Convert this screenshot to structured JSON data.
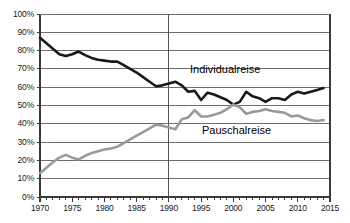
{
  "chart_data": {
    "type": "line",
    "title": "",
    "subtitle": "",
    "xlabel": "",
    "ylabel": "",
    "xlim": [
      1970,
      2015
    ],
    "ylim": [
      0,
      100
    ],
    "grid": true,
    "grid_axis": "y",
    "legend": "inline-annotations",
    "y_tick_labels": [
      "0%",
      "10%",
      "20%",
      "30%",
      "40%",
      "50%",
      "60%",
      "70%",
      "80%",
      "90%",
      "100%"
    ],
    "y_tick_values": [
      0,
      10,
      20,
      30,
      40,
      50,
      60,
      70,
      80,
      90,
      100
    ],
    "x_tick_labels": [
      "1970",
      "1975",
      "1980",
      "1985",
      "1990",
      "1995",
      "2000",
      "2005",
      "2010",
      "2015"
    ],
    "x_tick_values": [
      1970,
      1975,
      1980,
      1985,
      1990,
      1995,
      2000,
      2005,
      2010,
      2015
    ],
    "x_minor_tick_interval": 1,
    "annotations": [
      {
        "text": "Individualreise",
        "x": 1996,
        "y": 67,
        "series": "Individualreise"
      },
      {
        "text": "Pauschalreise",
        "x": 1998,
        "y": 34,
        "series": "Pauschalreise"
      }
    ],
    "reference_lines": [
      {
        "axis": "x",
        "value": 1990,
        "color": "#555555"
      }
    ],
    "x": [
      1970,
      1971,
      1972,
      1973,
      1974,
      1975,
      1976,
      1977,
      1978,
      1979,
      1980,
      1981,
      1982,
      1983,
      1984,
      1985,
      1986,
      1987,
      1988,
      1989,
      1990,
      1991,
      1992,
      1993,
      1994,
      1995,
      1996,
      1997,
      1998,
      1999,
      2000,
      2001,
      2002,
      2003,
      2004,
      2005,
      2006,
      2007,
      2008,
      2009,
      2010,
      2011,
      2012,
      2013,
      2014
    ],
    "series": [
      {
        "name": "Individualreise",
        "color": "#1a1a1a",
        "width": 2.6,
        "values": [
          87,
          84,
          81,
          78,
          77,
          78,
          79.5,
          77.5,
          76,
          75,
          74.5,
          74,
          74,
          72,
          70,
          68,
          65.5,
          63,
          60.5,
          61,
          62,
          63,
          61,
          57.5,
          58,
          53,
          57,
          56,
          54.5,
          53,
          50.5,
          52,
          57.5,
          55,
          54,
          52,
          54,
          54,
          53,
          56,
          57.5,
          56.5,
          57.5,
          58.5,
          59.5
        ]
      },
      {
        "name": "Pauschalreise",
        "color": "#9a9a9a",
        "width": 2.6,
        "values": [
          13,
          16,
          19,
          21.5,
          23,
          21.5,
          20.5,
          22.5,
          24,
          25,
          26,
          26.5,
          27.5,
          29.5,
          31.5,
          33.5,
          35.5,
          37.5,
          39.5,
          39,
          38,
          37,
          42.5,
          43.5,
          47.5,
          44,
          44,
          45,
          46,
          48,
          50.5,
          49,
          45.5,
          46.5,
          47,
          48,
          47,
          46.5,
          46,
          44,
          44.5,
          43,
          42,
          41.5,
          42
        ]
      }
    ]
  },
  "axes": {
    "plot_left": 40,
    "plot_right": 330,
    "plot_top": 14,
    "plot_bottom": 197
  },
  "labels": {
    "individual": "Individualreise",
    "pauschal": "Pauschalreise"
  }
}
